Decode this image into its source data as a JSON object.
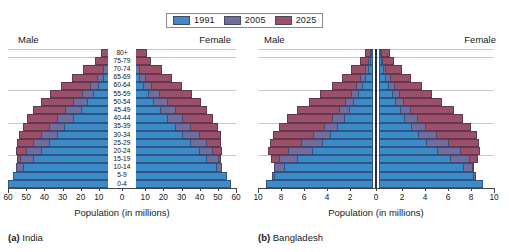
{
  "legend": {
    "entries": [
      {
        "label": "1991",
        "color": "#3a8bc8"
      },
      {
        "label": "2005",
        "color": "#6f6e9e"
      },
      {
        "label": "2025",
        "color": "#9e4f68"
      }
    ]
  },
  "labels": {
    "male": "Male",
    "female": "Female",
    "axis_title": "Population (in millions)"
  },
  "captions": {
    "india_prefix": "(a)",
    "india": "India",
    "bangladesh_prefix": "(b)",
    "bangladesh": "Bangladesh"
  },
  "chart_data": [
    {
      "type": "bar",
      "subtype": "population-pyramid",
      "title": "(a) India",
      "xlabel": "Population (in millions)",
      "ylabel": "",
      "grid": true,
      "legend_position": "top-center",
      "xlim": [
        -60,
        60
      ],
      "xticks": [
        60,
        50,
        40,
        30,
        20,
        10,
        0,
        10,
        20,
        30,
        40,
        50,
        60
      ],
      "side_labels": [
        "Male",
        "Female"
      ],
      "categories": [
        "0-4",
        "5-9",
        "10-14",
        "15-19",
        "20-24",
        "25-29",
        "30-34",
        "35-39",
        "40-44",
        "45-49",
        "50-54",
        "55-59",
        "60-64",
        "65-69",
        "70-74",
        "75-79",
        "80+"
      ],
      "series": [
        {
          "name": "1991",
          "color": "#3a8bc8",
          "male": [
            60.0,
            57.5,
            52.0,
            46.5,
            42.0,
            37.5,
            33.0,
            29.0,
            24.0,
            20.0,
            16.5,
            13.0,
            10.5,
            7.5,
            5.0,
            3.0,
            1.5
          ],
          "female": [
            57.5,
            55.0,
            49.5,
            44.0,
            40.0,
            35.5,
            31.0,
            27.0,
            22.5,
            18.5,
            15.0,
            12.0,
            9.5,
            7.0,
            4.5,
            2.5,
            1.5
          ]
        },
        {
          "name": "2005",
          "color": "#6f6e9e",
          "male": [
            57.0,
            56.5,
            55.5,
            53.5,
            50.0,
            46.0,
            42.0,
            37.5,
            33.0,
            28.5,
            24.0,
            19.0,
            15.0,
            11.0,
            7.5,
            4.5,
            2.5
          ],
          "female": [
            54.0,
            53.5,
            52.5,
            50.5,
            47.5,
            44.0,
            40.0,
            35.5,
            31.0,
            27.0,
            22.5,
            18.0,
            14.0,
            10.5,
            7.0,
            4.0,
            2.5
          ]
        },
        {
          "name": "2025",
          "color": "#9e4f68",
          "male": [
            51.0,
            52.5,
            54.0,
            55.0,
            55.5,
            55.0,
            54.0,
            52.0,
            49.5,
            46.0,
            42.0,
            37.0,
            31.0,
            25.0,
            18.5,
            12.0,
            9.0
          ],
          "female": [
            48.0,
            49.5,
            51.0,
            52.0,
            52.5,
            52.0,
            51.5,
            50.0,
            47.5,
            44.0,
            40.5,
            36.0,
            30.5,
            25.0,
            19.0,
            13.0,
            11.0
          ]
        }
      ]
    },
    {
      "type": "bar",
      "subtype": "population-pyramid",
      "title": "(b) Bangladesh",
      "xlabel": "Population (in millions)",
      "ylabel": "",
      "grid": true,
      "legend_position": "top-center",
      "xlim": [
        -10,
        10
      ],
      "xticks": [
        10,
        8,
        6,
        4,
        2,
        0,
        2,
        4,
        6,
        8,
        10
      ],
      "side_labels": [
        "Male",
        "Female"
      ],
      "categories": [
        "0-4",
        "5-9",
        "10-14",
        "15-19",
        "20-24",
        "25-29",
        "30-34",
        "35-39",
        "40-44",
        "45-49",
        "50-54",
        "55-59",
        "60-64",
        "65-69",
        "70-74",
        "75-79",
        "80+"
      ],
      "series": [
        {
          "name": "1991",
          "color": "#3a8bc8",
          "male": [
            9.3,
            8.6,
            7.7,
            6.6,
            5.3,
            4.4,
            3.7,
            3.1,
            2.5,
            2.1,
            1.7,
            1.3,
            1.0,
            0.7,
            0.45,
            0.25,
            0.13
          ],
          "female": [
            9.0,
            8.3,
            7.4,
            6.3,
            5.1,
            4.2,
            3.5,
            2.9,
            2.3,
            1.9,
            1.5,
            1.2,
            0.9,
            0.6,
            0.4,
            0.22,
            0.13
          ]
        },
        {
          "name": "2005",
          "color": "#6f6e9e",
          "male": [
            8.9,
            8.8,
            8.6,
            8.2,
            7.4,
            6.3,
            5.2,
            4.3,
            3.6,
            3.0,
            2.4,
            1.9,
            1.5,
            1.1,
            0.7,
            0.4,
            0.22
          ],
          "female": [
            8.5,
            8.4,
            8.2,
            7.9,
            7.1,
            6.1,
            5.0,
            4.1,
            3.4,
            2.8,
            2.2,
            1.8,
            1.4,
            1.0,
            0.65,
            0.38,
            0.24
          ]
        },
        {
          "name": "2025",
          "color": "#9e4f68",
          "male": [
            8.1,
            8.3,
            8.6,
            8.9,
            9.1,
            9.0,
            8.7,
            8.2,
            7.5,
            6.6,
            5.6,
            4.6,
            3.6,
            2.7,
            1.9,
            1.1,
            0.7
          ],
          "female": [
            7.8,
            8.0,
            8.3,
            8.6,
            8.8,
            8.7,
            8.5,
            8.0,
            7.3,
            6.5,
            5.5,
            4.6,
            3.7,
            2.8,
            2.0,
            1.3,
            0.95
          ]
        }
      ]
    }
  ]
}
